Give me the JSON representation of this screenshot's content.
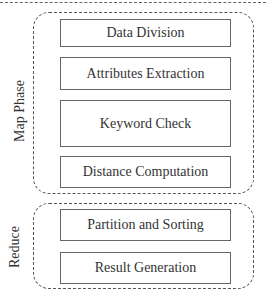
{
  "diagram": {
    "groups": [
      {
        "label": "Map Phase",
        "steps": [
          "Data Division",
          "Attributes Extraction",
          "Keyword Check",
          "Distance Computation"
        ]
      },
      {
        "label": "Reduce",
        "steps": [
          "Partition and Sorting",
          "Result Generation"
        ]
      }
    ]
  }
}
